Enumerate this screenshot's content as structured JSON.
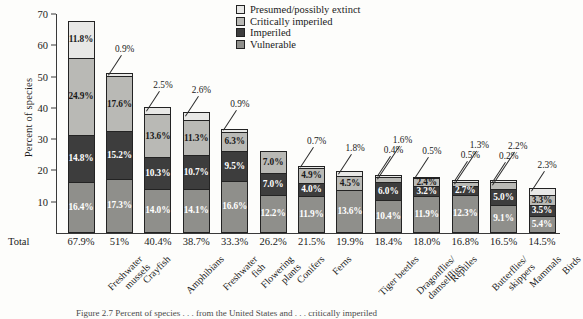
{
  "chart_data": {
    "type": "bar",
    "title": "",
    "xlabel": "",
    "ylabel": "Percent of species",
    "ylim": [
      0,
      70
    ],
    "yticks": [
      10,
      20,
      30,
      40,
      50,
      60,
      70
    ],
    "grid": false,
    "stacked": true,
    "legend_position": "top-right",
    "legend": [
      "Presumed/possibly extinct",
      "Critically imperiled",
      "Imperiled",
      "Vulnerable"
    ],
    "categories": [
      "Freshwater mussels",
      "Crayfish",
      "Amphibians",
      "Freshwater fish",
      "Flowering plants",
      "Conifers",
      "Ferns",
      "Tiger beetles",
      "Dragonflies/damselflies",
      "Reptiles",
      "Butterflies/skippers",
      "Mammals",
      "Birds"
    ],
    "series": [
      {
        "name": "Presumed/possibly extinct",
        "color": "#e8e8e6",
        "values": [
          11.8,
          0.9,
          2.5,
          2.6,
          0.9,
          0.0,
          0.7,
          1.8,
          0.4,
          0.5,
          0.5,
          0.2,
          2.3
        ]
      },
      {
        "name": "Critically imperiled",
        "color": "#b9b9b5",
        "values": [
          24.9,
          17.6,
          13.6,
          11.3,
          6.3,
          7.0,
          4.9,
          4.5,
          1.6,
          2.4,
          1.3,
          2.2,
          3.3
        ]
      },
      {
        "name": "Imperiled",
        "color": "#3d3d3d",
        "values": [
          14.8,
          15.2,
          10.3,
          10.7,
          9.5,
          7.0,
          4.0,
          0.0,
          6.0,
          3.2,
          2.7,
          5.0,
          3.5
        ]
      },
      {
        "name": "Vulnerable",
        "color": "#8f8f8b",
        "values": [
          16.4,
          17.3,
          14.0,
          14.1,
          16.6,
          12.2,
          11.9,
          13.6,
          10.4,
          11.9,
          12.3,
          9.1,
          5.4
        ]
      }
    ],
    "totals": [
      "67.9%",
      "51%",
      "40.4%",
      "38.7%",
      "33.3%",
      "26.2%",
      "21.5%",
      "19.9%",
      "18.4%",
      "18.0%",
      "16.8%",
      "16.5%",
      "14.5%"
    ],
    "total_row_label": "Total",
    "bars": [
      {
        "category": "Freshwater mussels",
        "label_lines": [
          "Freshwater",
          "mussels"
        ],
        "total": "67.9%",
        "segments": [
          {
            "class": "c-extinct",
            "value": 11.8,
            "label": "11.8%",
            "inside": true
          },
          {
            "class": "c-critical",
            "value": 24.9,
            "label": "24.9%",
            "inside": true
          },
          {
            "class": "c-imperiled",
            "value": 14.8,
            "label": "14.8%",
            "inside": true
          },
          {
            "class": "c-vulnerable",
            "value": 16.4,
            "label": "16.4%",
            "inside": true
          }
        ]
      },
      {
        "category": "Crayfish",
        "label_lines": [
          "Crayfish"
        ],
        "total": "51%",
        "segments": [
          {
            "class": "c-extinct",
            "value": 0.9,
            "label": "0.9%",
            "inside": false
          },
          {
            "class": "c-critical",
            "value": 17.6,
            "label": "17.6%",
            "inside": true
          },
          {
            "class": "c-imperiled",
            "value": 15.2,
            "label": "15.2%",
            "inside": true
          },
          {
            "class": "c-vulnerable",
            "value": 17.3,
            "label": "17.3%",
            "inside": true
          }
        ]
      },
      {
        "category": "Amphibians",
        "label_lines": [
          "Amphibians"
        ],
        "total": "40.4%",
        "segments": [
          {
            "class": "c-extinct",
            "value": 2.5,
            "label": "2.5%",
            "inside": false
          },
          {
            "class": "c-critical",
            "value": 13.6,
            "label": "13.6%",
            "inside": true
          },
          {
            "class": "c-imperiled",
            "value": 10.3,
            "label": "10.3%",
            "inside": true
          },
          {
            "class": "c-vulnerable",
            "value": 14.0,
            "label": "14.0%",
            "inside": true
          }
        ]
      },
      {
        "category": "Freshwater fish",
        "label_lines": [
          "Freshwater",
          "fish"
        ],
        "total": "38.7%",
        "segments": [
          {
            "class": "c-extinct",
            "value": 2.6,
            "label": "2.6%",
            "inside": false
          },
          {
            "class": "c-critical",
            "value": 11.3,
            "label": "11.3%",
            "inside": true
          },
          {
            "class": "c-imperiled",
            "value": 10.7,
            "label": "10.7%",
            "inside": true
          },
          {
            "class": "c-vulnerable",
            "value": 14.1,
            "label": "14.1%",
            "inside": true
          }
        ]
      },
      {
        "category": "Flowering plants",
        "label_lines": [
          "Flowering",
          "plants"
        ],
        "total": "33.3%",
        "segments": [
          {
            "class": "c-extinct",
            "value": 0.9,
            "label": "0.9%",
            "inside": false
          },
          {
            "class": "c-critical",
            "value": 6.3,
            "label": "6.3%",
            "inside": true
          },
          {
            "class": "c-imperiled",
            "value": 9.5,
            "label": "9.5%",
            "inside": true
          },
          {
            "class": "c-vulnerable",
            "value": 16.6,
            "label": "16.6%",
            "inside": true
          }
        ]
      },
      {
        "category": "Conifers",
        "label_lines": [
          "Conifers"
        ],
        "total": "26.2%",
        "segments": [
          {
            "class": "c-critical",
            "value": 7.0,
            "label": "7.0%",
            "inside": true
          },
          {
            "class": "c-imperiled",
            "value": 7.0,
            "label": "7.0%",
            "inside": true
          },
          {
            "class": "c-vulnerable",
            "value": 12.2,
            "label": "12.2%",
            "inside": true
          }
        ]
      },
      {
        "category": "Ferns",
        "label_lines": [
          "Ferns"
        ],
        "total": "21.5%",
        "segments": [
          {
            "class": "c-extinct",
            "value": 0.7,
            "label": "0.7%",
            "inside": false
          },
          {
            "class": "c-critical",
            "value": 4.9,
            "label": "4.9%",
            "inside": true
          },
          {
            "class": "c-imperiled",
            "value": 4.0,
            "label": "4.0%",
            "inside": true
          },
          {
            "class": "c-vulnerable",
            "value": 11.9,
            "label": "11.9%",
            "inside": true
          }
        ]
      },
      {
        "category": "Tiger beetles",
        "label_lines": [
          "Tiger beetles"
        ],
        "total": "19.9%",
        "segments": [
          {
            "class": "c-extinct",
            "value": 1.8,
            "label": "1.8%",
            "inside": false
          },
          {
            "class": "c-critical",
            "value": 4.5,
            "label": "4.5%",
            "inside": true
          },
          {
            "class": "c-vulnerable",
            "value": 13.6,
            "label": "13.6%",
            "inside": true
          }
        ]
      },
      {
        "category": "Dragonflies/damselflies",
        "label_lines": [
          "Dragonflies/",
          "damselflies"
        ],
        "total": "18.4%",
        "segments": [
          {
            "class": "c-extinct",
            "value": 0.4,
            "label": "0.4%",
            "inside": false
          },
          {
            "class": "c-critical",
            "value": 1.6,
            "label": "1.6%",
            "inside": false
          },
          {
            "class": "c-imperiled",
            "value": 6.0,
            "label": "6.0%",
            "inside": true
          },
          {
            "class": "c-vulnerable",
            "value": 10.4,
            "label": "10.4%",
            "inside": true
          }
        ]
      },
      {
        "category": "Reptiles",
        "label_lines": [
          "Reptiles"
        ],
        "total": "18.0%",
        "segments": [
          {
            "class": "c-extinct",
            "value": 0.5,
            "label": "0.5%",
            "inside": false
          },
          {
            "class": "c-critical",
            "value": 2.4,
            "label": "2.4%",
            "inside": true
          },
          {
            "class": "c-imperiled",
            "value": 3.2,
            "label": "3.2%",
            "inside": true
          },
          {
            "class": "c-vulnerable",
            "value": 11.9,
            "label": "11.9%",
            "inside": true
          }
        ]
      },
      {
        "category": "Butterflies/skippers",
        "label_lines": [
          "Butterflies/",
          "skippers"
        ],
        "total": "16.8%",
        "segments": [
          {
            "class": "c-extinct",
            "value": 0.5,
            "label": "0.5%",
            "inside": false
          },
          {
            "class": "c-critical",
            "value": 1.3,
            "label": "1.3%",
            "inside": false
          },
          {
            "class": "c-imperiled",
            "value": 2.7,
            "label": "2.7%",
            "inside": true
          },
          {
            "class": "c-vulnerable",
            "value": 12.3,
            "label": "12.3%",
            "inside": true
          }
        ]
      },
      {
        "category": "Mammals",
        "label_lines": [
          "Mammals"
        ],
        "total": "16.5%",
        "segments": [
          {
            "class": "c-extinct",
            "value": 0.2,
            "label": "0.2%",
            "inside": false
          },
          {
            "class": "c-critical",
            "value": 2.2,
            "label": "2.2%",
            "inside": false
          },
          {
            "class": "c-imperiled",
            "value": 5.0,
            "label": "5.0%",
            "inside": true
          },
          {
            "class": "c-vulnerable",
            "value": 9.1,
            "label": "9.1%",
            "inside": true
          }
        ]
      },
      {
        "category": "Birds",
        "label_lines": [
          "Birds"
        ],
        "total": "14.5%",
        "segments": [
          {
            "class": "c-extinct",
            "value": 2.3,
            "label": "2.3%",
            "inside": false
          },
          {
            "class": "c-critical",
            "value": 3.3,
            "label": "3.3%",
            "inside": true
          },
          {
            "class": "c-imperiled",
            "value": 3.5,
            "label": "3.5%",
            "inside": true
          },
          {
            "class": "c-vulnerable",
            "value": 5.4,
            "label": "5.4%",
            "inside": true
          }
        ]
      }
    ]
  },
  "caption": "Figure 2.7  Percent of species . . . from the United States and . . . critically imperiled"
}
